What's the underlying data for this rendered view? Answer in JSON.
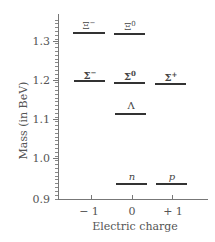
{
  "chart_data": {
    "type": "scatter",
    "title": "",
    "xlabel": "Electric charge",
    "ylabel": "Mass (in BeV)",
    "xlim": [
      -1.8,
      2.0
    ],
    "ylim": [
      0.9,
      1.38
    ],
    "x_ticks": [
      "− 1",
      "0",
      "+ 1"
    ],
    "y_ticks": [
      "0.9",
      "1.0",
      "1.1",
      "1.2",
      "1.3"
    ],
    "grid": false,
    "legend": null,
    "marker": "horizontal line segment",
    "points": [
      {
        "label": "Ξ−",
        "symbol": "Ξ",
        "sup": "−",
        "charge": -1,
        "mass": 1.32
      },
      {
        "label": "Ξ0",
        "symbol": "Ξ",
        "sup": "0",
        "charge": 0,
        "mass": 1.315
      },
      {
        "label": "Σ−",
        "symbol": "Σ",
        "sup": "−",
        "charge": -1,
        "mass": 1.197
      },
      {
        "label": "Σ0",
        "symbol": "Σ",
        "sup": "0",
        "charge": 0,
        "mass": 1.193
      },
      {
        "label": "Σ+",
        "symbol": "Σ",
        "sup": "+",
        "charge": 1,
        "mass": 1.189
      },
      {
        "label": "Λ",
        "symbol": "Λ",
        "sup": "",
        "charge": 0,
        "mass": 1.116
      },
      {
        "label": "n",
        "symbol": "n",
        "sup": "",
        "charge": 0,
        "mass": 0.94
      },
      {
        "label": "p",
        "symbol": "p",
        "sup": "",
        "charge": 1,
        "mass": 0.938
      }
    ]
  },
  "axes": {
    "y_title": "Mass (in BeV)",
    "x_title": "Electric charge",
    "y_tick_labels": [
      "1.3",
      "1.2",
      "1.1",
      "1.0",
      "0.9"
    ],
    "x_tick_labels": [
      "− 1",
      "0",
      "+ 1"
    ]
  },
  "particles": {
    "xi_minus": {
      "symbol": "Ξ",
      "sup": "−"
    },
    "xi_zero": {
      "symbol": "Ξ",
      "sup": "0"
    },
    "sigma_minus": {
      "symbol": "Σ",
      "sup": "−"
    },
    "sigma_zero": {
      "symbol": "Σ",
      "sup": "0"
    },
    "sigma_plus": {
      "symbol": "Σ",
      "sup": "+"
    },
    "lambda": {
      "symbol": "Λ",
      "sup": ""
    },
    "neutron": {
      "symbol": "n",
      "sup": ""
    },
    "proton": {
      "symbol": "p",
      "sup": ""
    }
  }
}
